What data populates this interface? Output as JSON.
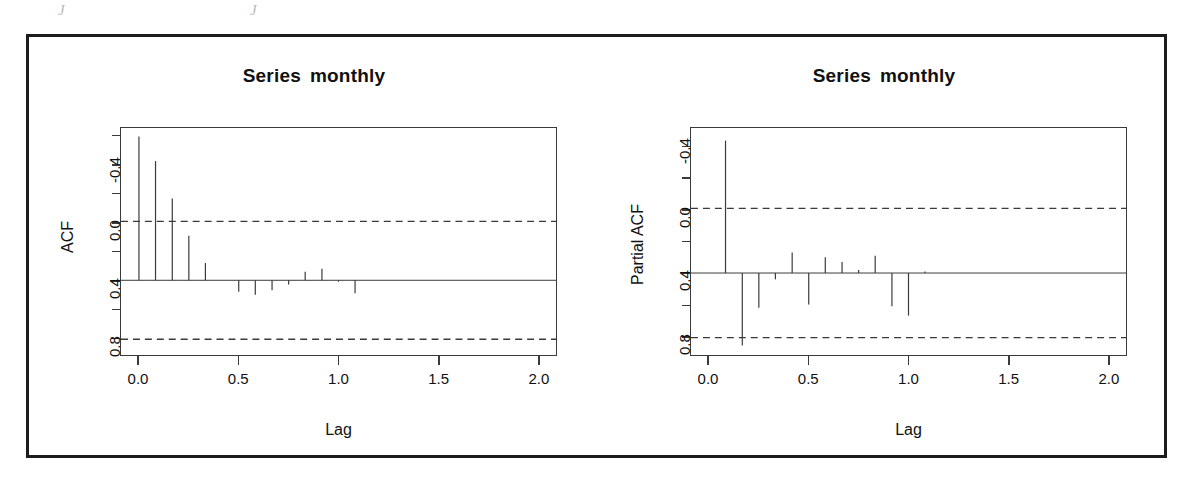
{
  "figure": {
    "background": "#ffffff",
    "frame_color": "#1c1c1c",
    "line_color": "#3a3a3a"
  },
  "scan_artifacts": {
    "mark_left": "J",
    "mark_right": "J"
  },
  "panels": [
    {
      "id": "acf",
      "title_word1": "Series",
      "title_word2": "monthly",
      "ylabel": "ACF",
      "xlabel": "Lag",
      "yticks": [
        "0.8",
        "0.4",
        "0.0",
        "-0.4"
      ],
      "xticks": [
        "0.0",
        "0.5",
        "1.0",
        "1.5",
        "2.0"
      ]
    },
    {
      "id": "pacf",
      "title_word1": "Series",
      "title_word2": "monthly",
      "ylabel": "Partial ACF",
      "xlabel": "Lag",
      "yticks": [
        "0.8",
        "0.4",
        "0.0",
        "-0.4"
      ],
      "xticks": [
        "0.0",
        "0.5",
        "1.0",
        "1.5",
        "2.0"
      ]
    }
  ],
  "chart_data": [
    {
      "type": "bar",
      "id": "acf",
      "title": "Series monthly",
      "xlabel": "Lag",
      "ylabel": "ACF",
      "xlim": [
        -0.09,
        2.09
      ],
      "ylim": [
        -0.52,
        1.06
      ],
      "xticks": [
        0.0,
        0.5,
        1.0,
        1.5,
        2.0
      ],
      "yticks": [
        -0.4,
        0.0,
        0.4,
        0.8
      ],
      "yticks_minor": [
        -0.2,
        0.2,
        0.6,
        1.0
      ],
      "grid": false,
      "legend": null,
      "zero_line": 0.0,
      "confidence_bands": [
        0.41,
        -0.41
      ],
      "confidence_style": "dashed",
      "x": [
        0.0,
        0.083,
        0.167,
        0.25,
        0.333,
        0.417,
        0.5,
        0.583,
        0.667,
        0.75,
        0.833,
        0.917,
        1.0,
        1.083
      ],
      "values": [
        1.0,
        0.83,
        0.57,
        0.31,
        0.12,
        0.0,
        -0.08,
        -0.1,
        -0.07,
        -0.03,
        0.06,
        0.08,
        -0.01,
        -0.09
      ]
    },
    {
      "type": "bar",
      "id": "pacf",
      "title": "Series monthly",
      "xlabel": "Lag",
      "ylabel": "Partial ACF",
      "xlim": [
        -0.09,
        2.09
      ],
      "ylim": [
        -0.52,
        0.92
      ],
      "xticks": [
        0.0,
        0.5,
        1.0,
        1.5,
        2.0
      ],
      "yticks": [
        -0.4,
        0.0,
        0.4,
        0.8
      ],
      "yticks_minor": [
        -0.2,
        0.2,
        0.6
      ],
      "grid": false,
      "legend": null,
      "zero_line": 0.0,
      "confidence_bands": [
        0.41,
        -0.41
      ],
      "confidence_style": "dashed",
      "x": [
        0.083,
        0.167,
        0.25,
        0.333,
        0.417,
        0.5,
        0.583,
        0.667,
        0.75,
        0.833,
        0.917,
        1.0,
        1.083,
        1.167
      ],
      "values": [
        0.84,
        -0.46,
        -0.22,
        -0.04,
        0.13,
        -0.2,
        0.1,
        0.07,
        0.02,
        0.11,
        -0.21,
        -0.27,
        0.01,
        0.0
      ]
    }
  ]
}
